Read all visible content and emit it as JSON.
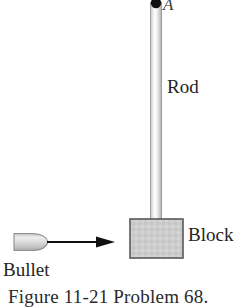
{
  "figure": {
    "background_color": "#ffffff",
    "caption": "Figure 11-21  Problem 68.",
    "labels": {
      "pivot": "A",
      "rod": "Rod",
      "block": "Block",
      "bullet": "Bullet"
    },
    "colors": {
      "rod_fill": "#d9d9d9",
      "rod_highlight": "#fbfbfb",
      "rod_edge": "#9a9a9a",
      "block_fill": "#cfcfcf",
      "block_border": "#5a5a5a",
      "bullet_fill": "#d2d2d2",
      "bullet_edge": "#8f8f8f",
      "arrow": "#111111",
      "pivot_dot": "#101010",
      "text": "#242424"
    },
    "elements": {
      "pivot_dot": {
        "cx": 156,
        "cy": 3,
        "r": 5
      },
      "rod": {
        "x": 150,
        "y": 2,
        "width": 12,
        "height": 218
      },
      "block": {
        "x": 130,
        "y": 219,
        "width": 53,
        "height": 39
      },
      "bullet": {
        "x": 14,
        "y": 233,
        "width": 34,
        "height": 19
      },
      "arrow": {
        "x1": 48,
        "y1": 242,
        "x2": 114,
        "y2": 242,
        "head_width": 20,
        "head_height": 11
      }
    }
  }
}
